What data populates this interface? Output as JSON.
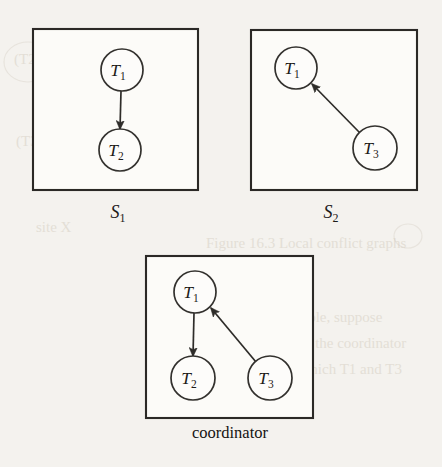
{
  "figure": {
    "caption": "Local conflict graphs at two sites and the merged graph at the coordinator",
    "background_color": "#f4f2ee",
    "ink_color": "#2b2926",
    "panels": [
      {
        "id": "site-1",
        "label": "S",
        "label_sub": "1",
        "label_full": "S1",
        "box": {
          "x": 33,
          "y": 29,
          "w": 165,
          "h": 161
        },
        "label_pos": {
          "x": 121,
          "y": 218
        },
        "nodes": [
          {
            "id": "T1",
            "label": "T",
            "label_sub": "1",
            "cx": 122,
            "cy": 70,
            "r": 21
          },
          {
            "id": "T2",
            "label": "T",
            "label_sub": "2",
            "cx": 120,
            "cy": 150,
            "r": 21
          }
        ],
        "edges": [
          {
            "from": "T1",
            "to": "T2",
            "x1": 121,
            "y1": 91,
            "x2": 120,
            "y2": 129
          }
        ]
      },
      {
        "id": "site-2",
        "label": "S",
        "label_sub": "2",
        "label_full": "S2",
        "box": {
          "x": 251,
          "y": 30,
          "w": 166,
          "h": 160
        },
        "label_pos": {
          "x": 334,
          "y": 218
        },
        "nodes": [
          {
            "id": "T1",
            "label": "T",
            "label_sub": "1",
            "cx": 296,
            "cy": 68,
            "r": 21
          },
          {
            "id": "T3",
            "label": "T",
            "label_sub": "3",
            "cx": 375,
            "cy": 148,
            "r": 22
          }
        ],
        "edges": [
          {
            "from": "T3",
            "to": "T1",
            "x1": 360,
            "y1": 133,
            "x2": 312,
            "y2": 84
          }
        ]
      },
      {
        "id": "coordinator",
        "label": "coordinator",
        "label_sub": "",
        "label_full": "coordinator",
        "box": {
          "x": 146,
          "y": 256,
          "w": 167,
          "h": 162
        },
        "label_pos": {
          "x": 230,
          "y": 438
        },
        "nodes": [
          {
            "id": "T1",
            "label": "T",
            "label_sub": "1",
            "cx": 195,
            "cy": 292,
            "r": 21
          },
          {
            "id": "T2",
            "label": "T",
            "label_sub": "2",
            "cx": 193,
            "cy": 378,
            "r": 22
          },
          {
            "id": "T3",
            "label": "T",
            "label_sub": "3",
            "cx": 270,
            "cy": 378,
            "r": 22
          }
        ],
        "edges": [
          {
            "from": "T1",
            "to": "T2",
            "x1": 194,
            "y1": 313,
            "x2": 193,
            "y2": 356
          },
          {
            "from": "T3",
            "to": "T1",
            "x1": 256,
            "y1": 362,
            "x2": 211,
            "y2": 308
          }
        ]
      }
    ]
  }
}
